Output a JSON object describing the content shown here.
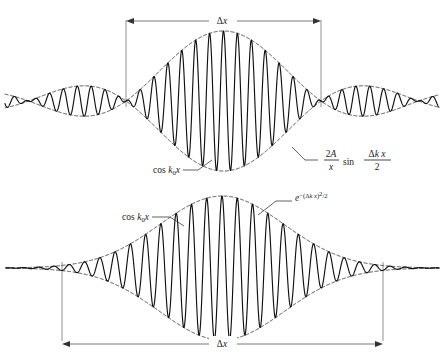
{
  "figure": {
    "background_color": "#ffffff",
    "curve_color": "#111111",
    "envelope_color": "#2b2b2b",
    "dimension_color": "#555555",
    "panels": [
      {
        "id": "sinc-packet",
        "name": "top-panel",
        "dimension_label": "Δx",
        "dimension_label_position": "top",
        "carrier_label": "cos k₀x",
        "envelope_label_parts": {
          "numerator": "2A",
          "denominator": "x",
          "function": "sin",
          "arg_numerator": "Δk x",
          "arg_denominator": "2"
        },
        "envelope_label_plain": "2A/x sin(Δk x/2)"
      },
      {
        "id": "gaussian-packet",
        "name": "bottom-panel",
        "dimension_label": "Δx",
        "dimension_label_position": "bottom",
        "carrier_label": "cos k₀x",
        "envelope_label_parts": {
          "base": "e",
          "exponent_prefix": "−(",
          "exponent_body": "Δk x",
          "exponent_suffix": ")²/2"
        },
        "envelope_label_plain": "e−(Δk x)²/2"
      }
    ]
  },
  "chart_data": {
    "type": "line",
    "xlabel": "x",
    "ylabel": "ψ(x)",
    "grid": false,
    "legend_position": "inline-annotations",
    "series": [
      {
        "name": "sinc wave packet",
        "panel": "top-panel",
        "formula": "(2A/x) sin(Δk x/2) cos(k₀ x)",
        "envelope_formula": "± (2A/x) sin(Δk x/2)",
        "carrier_formula": "cos k₀ x",
        "carrier_cycles_in_main_lobe": 14,
        "x_domain_px": [
          5,
          439
        ],
        "baseline_y_px": 101,
        "main_lobe_x_px": [
          126,
          321
        ],
        "peak_amplitude_px": 70,
        "sidelobe_count_each_side": 3,
        "sidelobe_relative_amplitudes": [
          0.24,
          0.12,
          0.07
        ]
      },
      {
        "name": "gaussian wave packet",
        "panel": "bottom-panel",
        "formula": "e^{-(Δk x)²/2} cos(k₀ x)",
        "envelope_formula": "± e^{-(Δk x)²/2}",
        "carrier_formula": "cos k₀ x",
        "carrier_cycles_in_packet": 21,
        "x_domain_px": [
          62,
          383
        ],
        "baseline_y_px": 268,
        "packet_center_x_px": 222,
        "peak_amplitude_px": 72,
        "gaussian_sigma_px": 62
      }
    ],
    "annotations": [
      {
        "text": "Δx",
        "panel": "top-panel",
        "role": "dimension",
        "x_px": 222,
        "y_px": 17
      },
      {
        "text": "cos k₀x",
        "panel": "top-panel",
        "role": "carrier-callout",
        "x_px": 152,
        "y_px": 172
      },
      {
        "text": "2A/x sin(Δk x/2)",
        "panel": "top-panel",
        "role": "envelope-callout",
        "x_px": 340,
        "y_px": 163
      },
      {
        "text": "cos k₀x",
        "panel": "bottom-panel",
        "role": "carrier-callout",
        "x_px": 120,
        "y_px": 219
      },
      {
        "text": "e−(Δk x)²/2",
        "panel": "bottom-panel",
        "role": "envelope-callout",
        "x_px": 312,
        "y_px": 197
      },
      {
        "text": "Δx",
        "panel": "bottom-panel",
        "role": "dimension",
        "x_px": 222,
        "y_px": 345
      }
    ]
  }
}
